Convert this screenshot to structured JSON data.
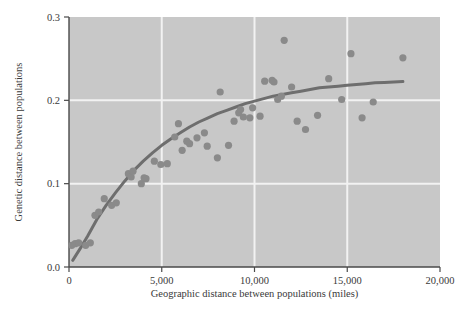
{
  "chart_data": {
    "type": "scatter",
    "title": "",
    "xlabel": "Geographic distance between populations (miles)",
    "ylabel": "Genetic distance between populations",
    "xlim": [
      0,
      20000
    ],
    "ylim": [
      0.0,
      0.3
    ],
    "xticks": [
      0,
      5000,
      10000,
      15000,
      20000
    ],
    "xticklabels": [
      "0",
      "5,000",
      "10,000",
      "15,000",
      "20,000"
    ],
    "yticks": [
      0.0,
      0.1,
      0.2,
      0.3
    ],
    "yticklabels": [
      "0.0",
      "0.1",
      "0.2",
      "0.3"
    ],
    "grid": true,
    "grid_color": "#f2f2f2",
    "plot_background": "#c8c8c8",
    "point_color": "#8a8a8a",
    "point_radius": 3.6,
    "line_color": "#6e6e6e",
    "line_width": 3.0,
    "legend": null,
    "series": [
      {
        "name": "Population pairs",
        "type": "scatter",
        "points": [
          [
            150,
            0.026
          ],
          [
            330,
            0.028
          ],
          [
            520,
            0.029
          ],
          [
            900,
            0.026
          ],
          [
            1150,
            0.029
          ],
          [
            1400,
            0.062
          ],
          [
            1600,
            0.066
          ],
          [
            1900,
            0.082
          ],
          [
            2300,
            0.074
          ],
          [
            2550,
            0.077
          ],
          [
            3200,
            0.112
          ],
          [
            3350,
            0.108
          ],
          [
            3450,
            0.115
          ],
          [
            3900,
            0.1
          ],
          [
            4050,
            0.107
          ],
          [
            4150,
            0.106
          ],
          [
            4600,
            0.127
          ],
          [
            4950,
            0.123
          ],
          [
            5300,
            0.124
          ],
          [
            5700,
            0.156
          ],
          [
            5900,
            0.172
          ],
          [
            6100,
            0.14
          ],
          [
            6350,
            0.151
          ],
          [
            6500,
            0.148
          ],
          [
            6900,
            0.155
          ],
          [
            7300,
            0.161
          ],
          [
            7450,
            0.145
          ],
          [
            8000,
            0.131
          ],
          [
            8150,
            0.21
          ],
          [
            8600,
            0.146
          ],
          [
            8900,
            0.175
          ],
          [
            9150,
            0.185
          ],
          [
            9250,
            0.189
          ],
          [
            9400,
            0.18
          ],
          [
            9750,
            0.179
          ],
          [
            9900,
            0.191
          ],
          [
            10300,
            0.181
          ],
          [
            10550,
            0.223
          ],
          [
            10950,
            0.224
          ],
          [
            11050,
            0.222
          ],
          [
            11250,
            0.201
          ],
          [
            11450,
            0.205
          ],
          [
            11600,
            0.272
          ],
          [
            12000,
            0.216
          ],
          [
            12300,
            0.175
          ],
          [
            12750,
            0.165
          ],
          [
            13400,
            0.182
          ],
          [
            14000,
            0.226
          ],
          [
            14700,
            0.201
          ],
          [
            15200,
            0.256
          ],
          [
            15800,
            0.179
          ],
          [
            16400,
            0.198
          ],
          [
            18000,
            0.251
          ]
        ]
      },
      {
        "name": "Fitted curve",
        "type": "line",
        "points": [
          [
            200,
            0.008
          ],
          [
            600,
            0.022
          ],
          [
            1000,
            0.037
          ],
          [
            1500,
            0.057
          ],
          [
            2000,
            0.074
          ],
          [
            2500,
            0.089
          ],
          [
            3000,
            0.103
          ],
          [
            3500,
            0.116
          ],
          [
            4000,
            0.127
          ],
          [
            4500,
            0.137
          ],
          [
            5000,
            0.146
          ],
          [
            5500,
            0.154
          ],
          [
            6000,
            0.161
          ],
          [
            6500,
            0.168
          ],
          [
            7000,
            0.174
          ],
          [
            7500,
            0.179
          ],
          [
            8000,
            0.184
          ],
          [
            8500,
            0.188
          ],
          [
            9000,
            0.192
          ],
          [
            9500,
            0.196
          ],
          [
            10000,
            0.199
          ],
          [
            10500,
            0.202
          ],
          [
            11000,
            0.205
          ],
          [
            11500,
            0.207
          ],
          [
            12000,
            0.209
          ],
          [
            12500,
            0.211
          ],
          [
            13000,
            0.213
          ],
          [
            13500,
            0.215
          ],
          [
            14000,
            0.216
          ],
          [
            14500,
            0.217
          ],
          [
            15000,
            0.218
          ],
          [
            15500,
            0.219
          ],
          [
            16000,
            0.22
          ],
          [
            16500,
            0.221
          ],
          [
            17000,
            0.2215
          ],
          [
            17500,
            0.222
          ],
          [
            18000,
            0.2225
          ]
        ]
      }
    ]
  }
}
